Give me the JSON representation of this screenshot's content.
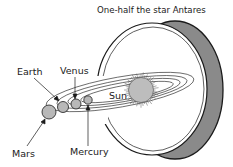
{
  "title": "One-half the star Antares",
  "labels": {
    "sun": "Sun",
    "earth": "Earth",
    "venus": "Venus",
    "mars": "Mars",
    "mercury": "Mercury"
  },
  "colors": {
    "shell_shade": "#8a8a8a",
    "planet_fill": "#b8b8b8",
    "sun_fill": "#bdbdbd",
    "ink": "#1a1a1a"
  }
}
